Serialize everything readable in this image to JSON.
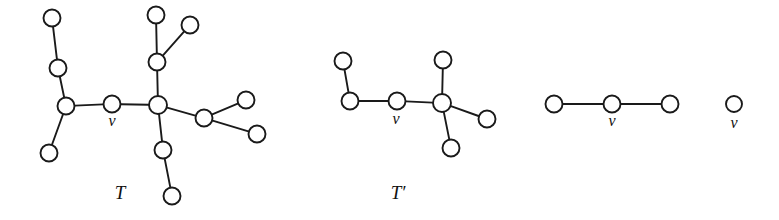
{
  "figure": {
    "title": "",
    "background_color": "#ffffff",
    "stroke_color": "#1a1a1a",
    "node_fill_color": "#ffffff",
    "vertex_label": "v",
    "panels": [
      {
        "id": "panel-T",
        "caption": "T",
        "caption_x": 120,
        "caption_y": 199,
        "marked_vertex_label": "v",
        "marked_vertex_label_x": 112,
        "marked_vertex_label_y": 126,
        "nodes": [
          {
            "id": "t-a1",
            "x": 52,
            "y": 18,
            "r": 8.5
          },
          {
            "id": "t-a2",
            "x": 58,
            "y": 68,
            "r": 8.5
          },
          {
            "id": "t-b",
            "x": 66,
            "y": 106,
            "r": 8.5
          },
          {
            "id": "t-a3",
            "x": 49,
            "y": 153,
            "r": 8.5
          },
          {
            "id": "t-v",
            "x": 112,
            "y": 104,
            "r": 8.5
          },
          {
            "id": "t-c",
            "x": 158,
            "y": 105,
            "r": 9.0
          },
          {
            "id": "t-d",
            "x": 157,
            "y": 62,
            "r": 8.5
          },
          {
            "id": "t-d1",
            "x": 156,
            "y": 15,
            "r": 8.5
          },
          {
            "id": "t-d2",
            "x": 190,
            "y": 25,
            "r": 8.5
          },
          {
            "id": "t-e",
            "x": 204,
            "y": 118,
            "r": 8.5
          },
          {
            "id": "t-e1",
            "x": 246,
            "y": 100,
            "r": 8.5
          },
          {
            "id": "t-e2",
            "x": 257,
            "y": 134,
            "r": 8.5
          },
          {
            "id": "t-f",
            "x": 163,
            "y": 150,
            "r": 8.5
          },
          {
            "id": "t-f1",
            "x": 172,
            "y": 196,
            "r": 8.5
          }
        ],
        "edges": [
          {
            "from": "t-a1",
            "to": "t-a2"
          },
          {
            "from": "t-a2",
            "to": "t-b"
          },
          {
            "from": "t-b",
            "to": "t-a3"
          },
          {
            "from": "t-b",
            "to": "t-v"
          },
          {
            "from": "t-v",
            "to": "t-c"
          },
          {
            "from": "t-c",
            "to": "t-d"
          },
          {
            "from": "t-d",
            "to": "t-d1"
          },
          {
            "from": "t-d",
            "to": "t-d2"
          },
          {
            "from": "t-c",
            "to": "t-e"
          },
          {
            "from": "t-e",
            "to": "t-e1"
          },
          {
            "from": "t-e",
            "to": "t-e2"
          },
          {
            "from": "t-c",
            "to": "t-f"
          },
          {
            "from": "t-f",
            "to": "t-f1"
          }
        ]
      },
      {
        "id": "panel-Tprime",
        "caption": "T′",
        "caption_x": 398,
        "caption_y": 199,
        "marked_vertex_label": "v",
        "marked_vertex_label_x": 396,
        "marked_vertex_label_y": 124,
        "nodes": [
          {
            "id": "p-a1",
            "x": 343,
            "y": 61,
            "r": 8.5
          },
          {
            "id": "p-b",
            "x": 350,
            "y": 101,
            "r": 8.5
          },
          {
            "id": "p-v",
            "x": 397,
            "y": 101,
            "r": 8.5
          },
          {
            "id": "p-c",
            "x": 442,
            "y": 103,
            "r": 9.0
          },
          {
            "id": "p-c1",
            "x": 443,
            "y": 60,
            "r": 8.5
          },
          {
            "id": "p-c2",
            "x": 487,
            "y": 119,
            "r": 8.5
          },
          {
            "id": "p-c3",
            "x": 451,
            "y": 148,
            "r": 8.5
          }
        ],
        "edges": [
          {
            "from": "p-a1",
            "to": "p-b"
          },
          {
            "from": "p-b",
            "to": "p-v"
          },
          {
            "from": "p-v",
            "to": "p-c"
          },
          {
            "from": "p-c",
            "to": "p-c1"
          },
          {
            "from": "p-c",
            "to": "p-c2"
          },
          {
            "from": "p-c",
            "to": "p-c3"
          }
        ]
      },
      {
        "id": "panel-path",
        "caption": "",
        "caption_x": 0,
        "caption_y": 0,
        "marked_vertex_label": "v",
        "marked_vertex_label_x": 612,
        "marked_vertex_label_y": 126,
        "nodes": [
          {
            "id": "q-l",
            "x": 554,
            "y": 104,
            "r": 8.5
          },
          {
            "id": "q-v",
            "x": 612,
            "y": 104,
            "r": 8.5
          },
          {
            "id": "q-r",
            "x": 670,
            "y": 104,
            "r": 8.5
          }
        ],
        "edges": [
          {
            "from": "q-l",
            "to": "q-v"
          },
          {
            "from": "q-v",
            "to": "q-r"
          }
        ]
      },
      {
        "id": "panel-single",
        "caption": "",
        "caption_x": 0,
        "caption_y": 0,
        "marked_vertex_label": "v",
        "marked_vertex_label_x": 734,
        "marked_vertex_label_y": 128,
        "nodes": [
          {
            "id": "s-v",
            "x": 734,
            "y": 104,
            "r": 8.0
          }
        ],
        "edges": []
      }
    ]
  }
}
